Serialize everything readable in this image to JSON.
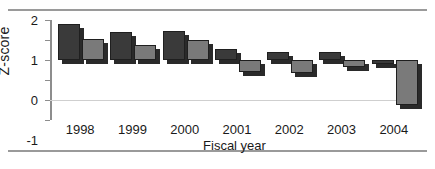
{
  "chart_data": {
    "type": "bar",
    "title": "",
    "xlabel": "Fiscal year",
    "ylabel": "Z-score",
    "categories": [
      "1998",
      "1999",
      "2000",
      "2001",
      "2002",
      "2003",
      "2004"
    ],
    "series": [
      {
        "name": "series-1",
        "color": "#3a3a3a",
        "values": [
          1.8,
          1.4,
          1.45,
          0.55,
          0.4,
          0.4,
          -0.2
        ]
      },
      {
        "name": "series-2",
        "color": "#7a7a7a",
        "values": [
          1.05,
          0.75,
          1.0,
          -0.6,
          -0.65,
          -0.35,
          -2.25
        ]
      }
    ],
    "yticks": [
      2,
      1,
      0,
      -1,
      -2,
      -3
    ],
    "ytick_labels": [
      "2",
      "1",
      "0",
      "-1",
      "-2",
      "-3"
    ],
    "ylim": [
      -3,
      2
    ],
    "grid": false,
    "legend": "none",
    "zero_line": true
  },
  "figure": {
    "top_rule_color": "#9a9a9a",
    "bottom_rule_color": "#9a9a9a",
    "background": "#ffffff",
    "axis_color": "#8d8d8d"
  }
}
